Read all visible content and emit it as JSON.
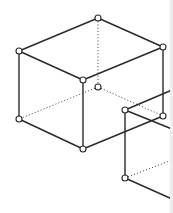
{
  "diagram": {
    "colors": {
      "line": "#2a2a2a",
      "hidden_line": "#555555",
      "vertex_fill": "#ffffff",
      "background": "#ffffff",
      "edge_strip": "#eeeeee"
    },
    "cube": {
      "vertices": {
        "top_back": [
          98,
          18
        ],
        "top_left": [
          19,
          51
        ],
        "top_right": [
          163,
          47
        ],
        "top_front": [
          83,
          80
        ],
        "bottom_back": [
          98,
          87
        ],
        "bottom_left": [
          19,
          119
        ],
        "bottom_right": [
          163,
          116
        ],
        "bottom_front": [
          83,
          149
        ]
      },
      "visible_edges": [
        [
          "top_back",
          "top_left"
        ],
        [
          "top_back",
          "top_right"
        ],
        [
          "top_left",
          "top_front"
        ],
        [
          "top_right",
          "top_front"
        ],
        [
          "top_left",
          "bottom_left"
        ],
        [
          "top_front",
          "bottom_front"
        ],
        [
          "top_right",
          "bottom_right"
        ],
        [
          "bottom_left",
          "bottom_front"
        ],
        [
          "bottom_front",
          "bottom_right"
        ]
      ],
      "hidden_edges": [
        [
          "top_back",
          "bottom_back"
        ],
        [
          "bottom_back",
          "bottom_left"
        ],
        [
          "bottom_back",
          "bottom_right"
        ]
      ]
    },
    "second_box": {
      "vertices": {
        "top_left": [
          125,
          110
        ],
        "bottom_left": [
          125,
          178
        ]
      },
      "solid_lines": [
        [
          [
            125,
            110
          ],
          [
            172,
            90
          ]
        ],
        [
          [
            125,
            110
          ],
          [
            172,
            129
          ]
        ],
        [
          [
            125,
            110
          ],
          [
            125,
            178
          ]
        ],
        [
          [
            125,
            178
          ],
          [
            172,
            199
          ]
        ]
      ],
      "dotted_lines": [
        [
          [
            125,
            178
          ],
          [
            172,
            160
          ]
        ]
      ]
    }
  }
}
